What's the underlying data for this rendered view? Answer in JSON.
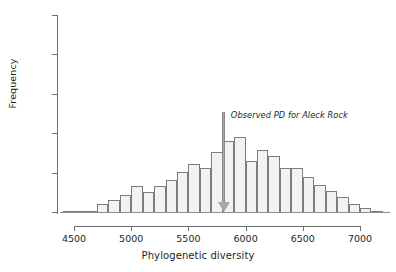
{
  "chart_data": {
    "type": "bar",
    "title": "",
    "subtitle": "",
    "xlabel": "Phylogenetic diversity",
    "ylabel": "Frequency",
    "xlim": [
      4400,
      7250
    ],
    "ylim": [
      0,
      250
    ],
    "grid": false,
    "legend": null,
    "bin_width": 100,
    "x_ticks": [
      4500,
      5000,
      5500,
      6000,
      6500,
      7000
    ],
    "x_tick_labels": [
      "4500",
      "5000",
      "5500",
      "6000",
      "6500",
      "7000"
    ],
    "y_ticks": [
      0,
      50,
      100,
      150,
      200,
      250
    ],
    "y_tick_labels": [
      "0",
      "50",
      "100",
      "150",
      "200",
      "250"
    ],
    "bin_starts": [
      4400,
      4500,
      4600,
      4700,
      4800,
      4900,
      5000,
      5100,
      5200,
      5300,
      5400,
      5500,
      5600,
      5700,
      5800,
      5900,
      6000,
      6100,
      6200,
      6300,
      6400,
      6500,
      6600,
      6700,
      6800,
      6900,
      7000,
      7100
    ],
    "categories": [
      "4400-4500",
      "4500-4600",
      "4600-4700",
      "4700-4800",
      "4800-4900",
      "4900-5000",
      "5000-5100",
      "5100-5200",
      "5200-5300",
      "5300-5400",
      "5400-5500",
      "5500-5600",
      "5600-5700",
      "5700-5800",
      "5800-5900",
      "5900-6000",
      "6000-6100",
      "6100-6200",
      "6200-6300",
      "6300-6400",
      "6400-6500",
      "6500-6600",
      "6600-6700",
      "6700-6800",
      "6800-6900",
      "6900-7000",
      "7000-7100",
      "7100-7200"
    ],
    "values": [
      1,
      1,
      3,
      12,
      16,
      23,
      34,
      27,
      34,
      42,
      52,
      62,
      57,
      78,
      92,
      96,
      66,
      80,
      72,
      57,
      57,
      46,
      36,
      28,
      20,
      12,
      6,
      2
    ],
    "bar_fill_color": "#f2f2f2",
    "bar_edge_color": "#7d7d7d",
    "annotations": [
      {
        "text": "Observed PD for Aleck Rock",
        "type": "arrow",
        "x_value": 5810,
        "y_top": 112,
        "arrow_color": "#a8a8a8",
        "italic": true
      }
    ]
  },
  "axes": {
    "y": {
      "title": "Frequency",
      "ticks": [
        {
          "label": "250",
          "value": 250
        },
        {
          "label": "200",
          "value": 200
        },
        {
          "label": "150",
          "value": 150
        },
        {
          "label": "100",
          "value": 100
        },
        {
          "label": "50",
          "value": 50
        },
        {
          "label": "0",
          "value": 0
        }
      ]
    },
    "x": {
      "title": "Phylogenetic diversity",
      "ticks": [
        {
          "label": "4500",
          "value": 4500
        },
        {
          "label": "5000",
          "value": 5000
        },
        {
          "label": "5500",
          "value": 5500
        },
        {
          "label": "6000",
          "value": 6000
        },
        {
          "label": "6500",
          "value": 6500
        },
        {
          "label": "7000",
          "value": 7000
        }
      ]
    }
  },
  "annotation": {
    "observed_pd_label": "Observed PD for Aleck Rock"
  }
}
